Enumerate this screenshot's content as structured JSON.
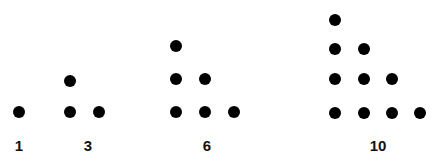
{
  "dot_color": "#000000",
  "groups": [
    {
      "label": "1",
      "label_pos": [
        19,
        145
      ],
      "dots": [
        [
          19,
          112
        ]
      ]
    },
    {
      "label": "3",
      "label_pos": [
        88,
        145
      ],
      "dots": [
        [
          70,
          112
        ],
        [
          99,
          112
        ],
        [
          70,
          81
        ]
      ]
    },
    {
      "label": "6",
      "label_pos": [
        207,
        145
      ],
      "dots": [
        [
          176,
          112
        ],
        [
          205,
          112
        ],
        [
          234,
          112
        ],
        [
          176,
          79
        ],
        [
          205,
          79
        ],
        [
          176,
          46
        ]
      ]
    },
    {
      "label": "10",
      "label_pos": [
        378,
        145
      ],
      "dots": [
        [
          335,
          113
        ],
        [
          364,
          113
        ],
        [
          392,
          113
        ],
        [
          420,
          113
        ],
        [
          335,
          79
        ],
        [
          364,
          79
        ],
        [
          392,
          79
        ],
        [
          335,
          49
        ],
        [
          364,
          49
        ],
        [
          335,
          20
        ]
      ]
    }
  ]
}
